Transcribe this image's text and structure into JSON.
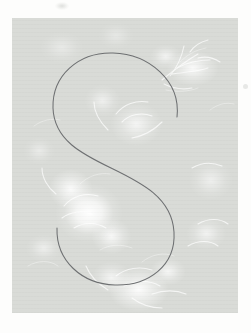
{
  "page": {
    "background_color": "#fdfdfc",
    "width": 251,
    "height": 333,
    "artifact_label": "print speck"
  },
  "artwork": {
    "title": "Floral monogram card",
    "alt_text": "Pale grey-green canvas printed with faded white roses and foliage, overlaid with a thin line-drawn letter S",
    "background_color": "#d9dbd7",
    "highlight_color": "#ffffff",
    "texture": "linen weave",
    "panel": {
      "left": 12,
      "top": 18,
      "width": 226,
      "height": 295
    },
    "motifs": [
      {
        "name": "rose-cluster-left",
        "position": "left-centre",
        "brightness": "high"
      },
      {
        "name": "rose-cluster-bottom",
        "position": "bottom-centre",
        "brightness": "high"
      },
      {
        "name": "flower-spray-upper-right",
        "position": "upper-right",
        "brightness": "medium"
      },
      {
        "name": "bloom-centre",
        "position": "centre",
        "brightness": "medium"
      },
      {
        "name": "foliage-right",
        "position": "right-middle",
        "brightness": "low"
      },
      {
        "name": "foliage-lower-left",
        "position": "lower-left",
        "brightness": "low"
      }
    ]
  },
  "monogram": {
    "letter": "S",
    "style": "single-stroke script",
    "stroke_color": "#6e7072",
    "stroke_width": 1.05,
    "bounds": {
      "x": 53,
      "y": 52,
      "width": 135,
      "height": 232
    },
    "terminals": [
      {
        "name": "upper-right-terminal",
        "x": 177,
        "y": 117
      },
      {
        "name": "lower-left-terminal",
        "x": 53,
        "y": 212
      }
    ],
    "path": "M 165 99 C 169 63 137 36 101 35 C 66 34 40 58 41 90 C 42 122 70 136 99 150 C 130 165 160 180 162 214 C 164 248 136 268 103 267 C 70 266 44 243 45 210"
  }
}
